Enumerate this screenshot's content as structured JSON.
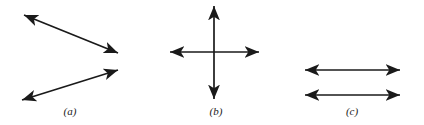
{
  "figure": {
    "background_color": "#ffffff",
    "stroke_color": "#1a1a1a",
    "width": 424,
    "height": 125,
    "panels": [
      {
        "id": "panel-a",
        "label": "(a)",
        "label_x": 70,
        "label_y": 106,
        "description": "Two double-headed arrows meeting at the right to form a wide chevron",
        "arrows": [
          {
            "name": "arrow-a-upper",
            "x1": 24,
            "y1": 15,
            "x2": 118,
            "y2": 53,
            "heads": "both"
          },
          {
            "name": "arrow-a-lower",
            "x1": 118,
            "y1": 70,
            "x2": 22,
            "y2": 100,
            "heads": "both"
          }
        ]
      },
      {
        "id": "panel-b",
        "label": "(b)",
        "label_x": 216,
        "label_y": 106,
        "description": "A vertical and a horizontal double-headed arrow crossing at a right angle",
        "arrows": [
          {
            "name": "arrow-b-vertical",
            "x1": 214,
            "y1": 6,
            "x2": 214,
            "y2": 99,
            "heads": "both"
          },
          {
            "name": "arrow-b-horizontal",
            "x1": 170,
            "y1": 52,
            "x2": 259,
            "y2": 52,
            "heads": "both"
          }
        ]
      },
      {
        "id": "panel-c",
        "label": "(c)",
        "label_x": 352,
        "label_y": 106,
        "description": "Two parallel horizontal double-headed arrows of equal length",
        "arrows": [
          {
            "name": "arrow-c-upper",
            "x1": 305,
            "y1": 70,
            "x2": 400,
            "y2": 70,
            "heads": "both"
          },
          {
            "name": "arrow-c-lower",
            "x1": 305,
            "y1": 95,
            "x2": 400,
            "y2": 95,
            "heads": "both"
          }
        ]
      }
    ]
  }
}
